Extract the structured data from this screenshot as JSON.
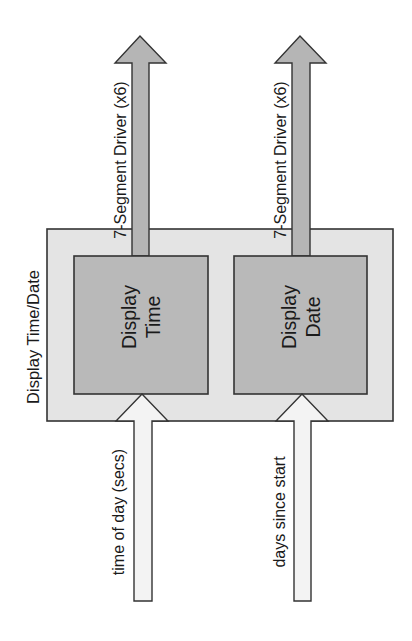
{
  "diagram": {
    "container": {
      "label": "Display Time/Date",
      "fill": "#e4e4e4"
    },
    "blocks": [
      {
        "line1": "Display",
        "line2": "Time",
        "fill": "#b9b9b9"
      },
      {
        "line1": "Display",
        "line2": "Date",
        "fill": "#b9b9b9"
      }
    ],
    "outputs": [
      {
        "label": "7-Segment Driver (x6)",
        "fill": "#b5b5b5"
      },
      {
        "label": "7-Segment Driver (x6)",
        "fill": "#b5b5b5"
      }
    ],
    "inputs": [
      {
        "label": "time of day (secs)",
        "fill": "#f3f3f3"
      },
      {
        "label": "days since start",
        "fill": "#f3f3f3"
      }
    ],
    "stroke": "#333333"
  }
}
